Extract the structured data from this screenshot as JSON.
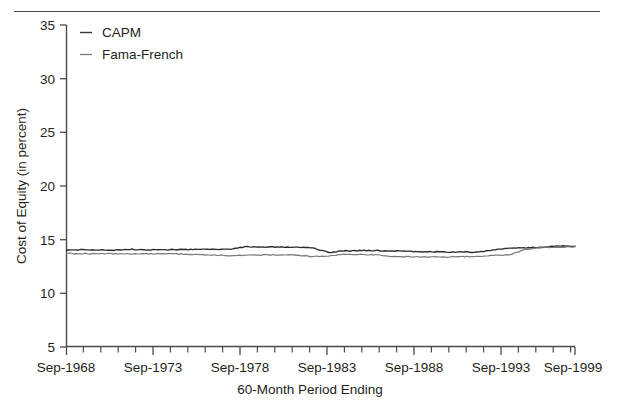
{
  "figure": {
    "has_top_rule": true,
    "background": "#ffffff",
    "ink": "#231f20"
  },
  "legend": {
    "position": "top-left-inside-plot",
    "items": [
      {
        "label": "CAPM",
        "marker": "line-dash",
        "color": "#2b2b2b"
      },
      {
        "label": "Fama-French",
        "marker": "line-dash",
        "color": "#6e6e6e"
      }
    ]
  },
  "axes": {
    "y": {
      "title": "Cost of Equity (in percent)",
      "ticks": [
        5,
        10,
        15,
        20,
        25,
        30,
        35
      ],
      "tick_labels": [
        "5",
        "10",
        "15",
        "20",
        "25",
        "30",
        "35"
      ],
      "min": 5,
      "max": 35
    },
    "x": {
      "title": "60-Month Period Ending",
      "major_tick_labels": [
        "Sep-1968",
        "Sep-1973",
        "Sep-1978",
        "Sep-1983",
        "Sep-1988",
        "Sep-1993",
        "Sep-1999"
      ],
      "minor_ticks_per_major": 5,
      "min_label": "Sep-1968",
      "max_label": "Sep-1999"
    },
    "grid": false
  },
  "chart_data": {
    "type": "line",
    "title": "",
    "xlabel": "60-Month Period Ending",
    "ylabel": "Cost of Equity (in percent)",
    "ylim": [
      5,
      35
    ],
    "xlim": [
      "Sep-1968",
      "Sep-1999"
    ],
    "grid": false,
    "legend_position": "upper left",
    "x_major_ticks": [
      "Sep-1968",
      "Sep-1973",
      "Sep-1978",
      "Sep-1983",
      "Sep-1988",
      "Sep-1993",
      "Sep-1999"
    ],
    "x": [
      "Sep-1968",
      "Sep-1969",
      "Sep-1970",
      "Sep-1971",
      "Sep-1972",
      "Sep-1973",
      "Sep-1974",
      "Sep-1975",
      "Sep-1976",
      "Sep-1977",
      "Sep-1978",
      "Sep-1979",
      "Sep-1980",
      "Sep-1981",
      "Sep-1982",
      "Sep-1983",
      "Sep-1984",
      "Sep-1985",
      "Sep-1986",
      "Sep-1987",
      "Sep-1988",
      "Sep-1989",
      "Sep-1990",
      "Sep-1991",
      "Sep-1992",
      "Sep-1993",
      "Sep-1994",
      "Sep-1995",
      "Sep-1996",
      "Sep-1997",
      "Sep-1998",
      "Sep-1999"
    ],
    "series": [
      {
        "name": "CAPM",
        "color": "#2b2b2b",
        "values": [
          14.05,
          14.05,
          14.05,
          14.02,
          14.1,
          14.05,
          14.06,
          14.08,
          14.1,
          14.1,
          14.12,
          14.35,
          14.3,
          14.32,
          14.3,
          14.25,
          13.8,
          13.95,
          13.98,
          13.98,
          13.95,
          13.9,
          13.88,
          13.85,
          13.85,
          13.82,
          14.05,
          14.2,
          14.25,
          14.3,
          14.4,
          14.4
        ]
      },
      {
        "name": "Fama-French",
        "color": "#6e6e6e",
        "values": [
          13.72,
          13.7,
          13.7,
          13.68,
          13.7,
          13.68,
          13.68,
          13.66,
          13.62,
          13.56,
          13.52,
          13.55,
          13.58,
          13.58,
          13.56,
          13.4,
          13.5,
          13.65,
          13.62,
          13.58,
          13.42,
          13.4,
          13.38,
          13.38,
          13.42,
          13.45,
          13.52,
          13.6,
          14.08,
          14.3,
          14.28,
          14.35
        ]
      }
    ]
  }
}
